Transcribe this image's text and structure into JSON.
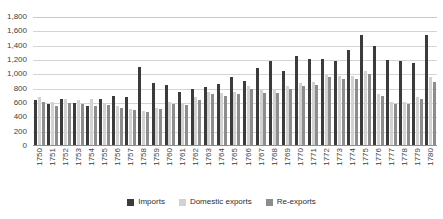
{
  "chart_data": {
    "type": "bar",
    "title": "",
    "xlabel": "",
    "ylabel": "",
    "ylim": [
      0,
      1800
    ],
    "ytick_step": 200,
    "grid": true,
    "legend_position": "bottom",
    "yticks": [
      "0",
      "200",
      "400",
      "600",
      "800",
      "1,000",
      "1,200",
      "1,400",
      "1,600",
      "1,800"
    ],
    "categories": [
      "1750",
      "1751",
      "1752",
      "1753",
      "1754",
      "1755",
      "1756",
      "1757",
      "1758",
      "1759",
      "1760",
      "1761",
      "1762",
      "1763",
      "1764",
      "1765",
      "1766",
      "1767",
      "1768",
      "1769",
      "1770",
      "1771",
      "1772",
      "1773",
      "1774",
      "1775",
      "1776",
      "1777",
      "1778",
      "1779",
      "1780"
    ],
    "series": [
      {
        "name": "Imports",
        "color": "#3b3b3b",
        "values": [
          640,
          580,
          660,
          600,
          560,
          650,
          700,
          690,
          1100,
          880,
          850,
          760,
          800,
          830,
          870,
          960,
          910,
          1090,
          1180,
          1050,
          1260,
          1220,
          1210,
          1180,
          1340,
          1550,
          1400,
          1200,
          1190,
          1160,
          1550
        ]
      },
      {
        "name": "Domestic exports",
        "color": "#d2d2d2",
        "values": [
          680,
          620,
          650,
          640,
          650,
          600,
          560,
          520,
          490,
          530,
          610,
          600,
          680,
          760,
          740,
          760,
          840,
          780,
          780,
          840,
          880,
          890,
          1010,
          980,
          980,
          1050,
          730,
          620,
          620,
          680,
          960
        ]
      },
      {
        "name": "Re-exports",
        "color": "#8d8d8d",
        "values": [
          620,
          560,
          600,
          590,
          560,
          570,
          530,
          500,
          480,
          520,
          580,
          570,
          640,
          720,
          700,
          720,
          800,
          740,
          740,
          790,
          840,
          850,
          960,
          930,
          930,
          1000,
          700,
          590,
          590,
          650,
          900
        ]
      }
    ]
  },
  "legend": {
    "items": [
      {
        "label": "Imports",
        "key": "imports"
      },
      {
        "label": "Domestic exports",
        "key": "domestic"
      },
      {
        "label": "Re-exports",
        "key": "reexports"
      }
    ]
  }
}
